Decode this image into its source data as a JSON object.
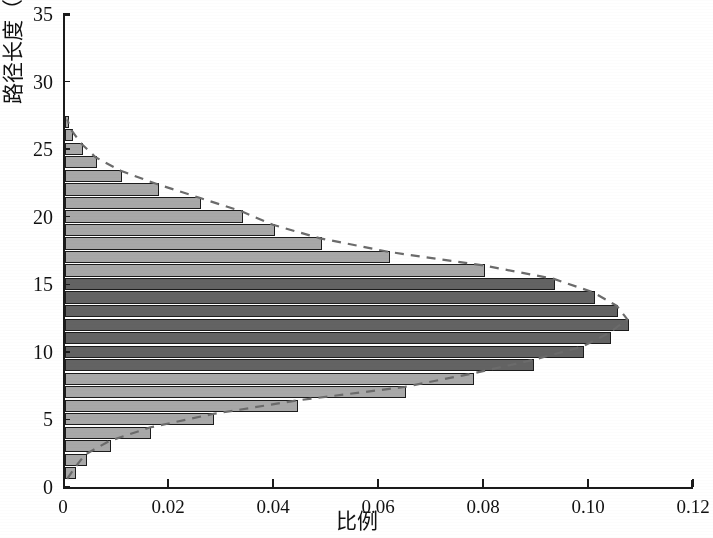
{
  "chart_data": {
    "type": "bar",
    "orientation": "horizontal",
    "title": "",
    "xlabel": "比例",
    "ylabel": "路径长度（L）",
    "ylabel_parts": {
      "prefix": "路径长度（",
      "italic": "L",
      "suffix": "）"
    },
    "xlim": [
      0,
      0.12
    ],
    "ylim": [
      0,
      35
    ],
    "xticks": [
      0,
      0.02,
      0.04,
      0.06,
      0.08,
      0.1,
      0.12
    ],
    "xticklabels": [
      "0",
      "0.02",
      "0.04",
      "0.06",
      "0.08",
      "0.10",
      "0.12"
    ],
    "yticks": [
      0,
      5,
      10,
      15,
      20,
      25,
      30,
      35
    ],
    "yticklabels": [
      "0",
      "5",
      "10",
      "15",
      "20",
      "25",
      "30",
      "35"
    ],
    "grid": false,
    "legend": false,
    "categories": [
      1,
      2,
      3,
      4,
      5,
      6,
      7,
      8,
      9,
      10,
      11,
      12,
      13,
      14,
      15,
      16,
      17,
      18,
      19,
      20,
      21,
      22,
      23,
      24,
      25,
      26,
      27
    ],
    "values": [
      0.0022,
      0.0042,
      0.0088,
      0.0165,
      0.0285,
      0.0445,
      0.065,
      0.078,
      0.0895,
      0.099,
      0.104,
      0.1075,
      0.1055,
      0.101,
      0.0935,
      0.08,
      0.062,
      0.049,
      0.04,
      0.034,
      0.026,
      0.018,
      0.011,
      0.0062,
      0.0035,
      0.0016,
      0.0008
    ],
    "bar_shades": [
      "light",
      "light",
      "light",
      "light",
      "light",
      "light",
      "light",
      "light",
      "dark",
      "dark",
      "dark",
      "dark",
      "dark",
      "dark",
      "dark",
      "light",
      "light",
      "light",
      "light",
      "light",
      "light",
      "light",
      "light",
      "light",
      "light",
      "light",
      "light"
    ],
    "overlay": {
      "type": "line",
      "style": "dashed",
      "name": "fitted-distribution-curve",
      "x": [
        0.0008,
        0.0022,
        0.0042,
        0.0088,
        0.0165,
        0.0285,
        0.0445,
        0.065,
        0.078,
        0.0895,
        0.099,
        0.104,
        0.1075,
        0.1055,
        0.101,
        0.0935,
        0.08,
        0.062,
        0.049,
        0.04,
        0.034,
        0.026,
        0.018,
        0.011,
        0.0062,
        0.0035,
        0.0016,
        0.0008
      ],
      "y": [
        0.6,
        1.4,
        2.4,
        3.4,
        4.4,
        5.4,
        6.4,
        7.4,
        8.4,
        9.4,
        10.4,
        11.4,
        12.4,
        13.4,
        14.4,
        15.4,
        16.4,
        17.4,
        18.4,
        19.4,
        20.4,
        21.4,
        22.4,
        23.4,
        24.4,
        25.4,
        26.4,
        27.2
      ]
    },
    "colors": {
      "bar_light": "#a8a8a8",
      "bar_dark": "#636363",
      "bar_edge": "#1c1c1c",
      "axis": "#1a1a1a",
      "curve": "#6b6b6b",
      "background": "#ffffff"
    }
  }
}
